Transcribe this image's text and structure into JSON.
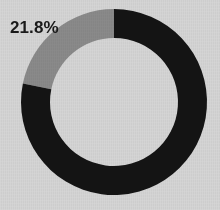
{
  "figure": {
    "background_color": "#d5d5d5",
    "width": 220,
    "height": 210
  },
  "labels": {
    "gray_slice_label": "21.8%"
  },
  "geometry": {
    "center_x": 114,
    "center_y": 102,
    "outer_radius": 93,
    "inner_radius": 64,
    "start_angle_deg": 0,
    "direction": "counterclockwise"
  },
  "chart_data": {
    "type": "pie",
    "variant": "donut",
    "title": "",
    "subtitle": "",
    "xlabel": "",
    "ylabel": "",
    "grid": false,
    "legend": "none",
    "hole_fraction": 0.688,
    "start_angle_deg": 90,
    "counterclock": true,
    "categories": [
      "Segment A",
      "Segment B"
    ],
    "values": [
      21.8,
      78.2
    ],
    "slices": [
      {
        "name": "Segment A",
        "value": 21.8,
        "percent": 21.8,
        "color": "#8a8a8a",
        "label": "21.8%",
        "label_shown": true,
        "start_angle_deg": 0.0,
        "end_angle_deg": 78.5
      },
      {
        "name": "Segment B",
        "value": 78.2,
        "percent": 78.2,
        "color": "#141414",
        "label": "",
        "label_shown": false,
        "start_angle_deg": 78.5,
        "end_angle_deg": 360.0
      }
    ],
    "annotations": [
      {
        "text": "21.8%",
        "x": 10,
        "y": 18,
        "color": "#1a1a1a"
      }
    ]
  }
}
